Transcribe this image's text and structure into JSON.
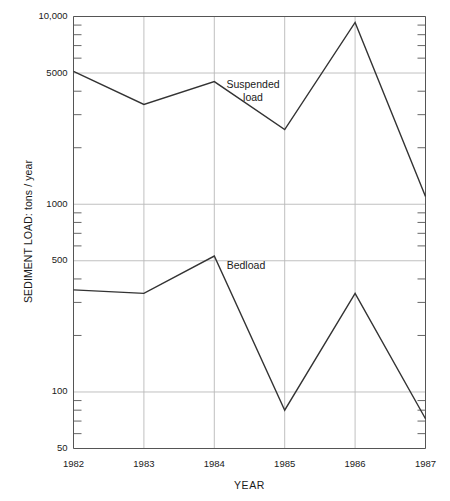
{
  "chart_data": {
    "type": "line",
    "title": "",
    "xlabel": "YEAR",
    "ylabel": "SEDIMENT LOAD: tons / year",
    "yscale": "log",
    "ylim": [
      50,
      10000
    ],
    "xlim": [
      1982,
      1987
    ],
    "grid": true,
    "legend_position": "inline-annotation",
    "categories": [
      "1982",
      "1983",
      "1984",
      "1985",
      "1986",
      "1987"
    ],
    "x": [
      1982,
      1983,
      1984,
      1985,
      1986,
      1987
    ],
    "series": [
      {
        "name": "Suspended load",
        "values": [
          5100,
          3400,
          4500,
          2500,
          9300,
          1100
        ],
        "color": "#333333"
      },
      {
        "name": "Bedload",
        "values": [
          350,
          335,
          530,
          80,
          335,
          72
        ],
        "color": "#333333"
      }
    ],
    "ytick_labels": [
      "10,000",
      "5000",
      "1000",
      "500",
      "100",
      "50"
    ],
    "ytick_values": [
      10000,
      5000,
      1000,
      500,
      100,
      50
    ],
    "xtick_labels": [
      "1982",
      "1983",
      "1984",
      "1985",
      "1986",
      "1987"
    ],
    "annotations": [
      {
        "text": "Suspended\nload",
        "line1": "Suspended",
        "line2": "load",
        "x": 1984.55,
        "y": 4300
      },
      {
        "text": "Bedload",
        "line1": "Bedload",
        "line2": "",
        "x": 1984.45,
        "y": 470
      }
    ],
    "colors": {
      "line": "#333333",
      "grid": "#b9b9b9",
      "axis": "#555555",
      "text": "#1a1a1a",
      "background": "#ffffff"
    }
  }
}
